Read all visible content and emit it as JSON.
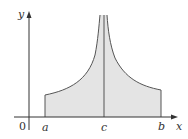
{
  "figure": {
    "axes": {
      "x_label": "x",
      "y_label": "y",
      "origin_label": "0"
    },
    "ticks": {
      "a": "a",
      "c": "c",
      "b": "b"
    },
    "colors": {
      "fill": "#e4e4e4",
      "stroke": "#555555",
      "axis": "#333333"
    }
  }
}
